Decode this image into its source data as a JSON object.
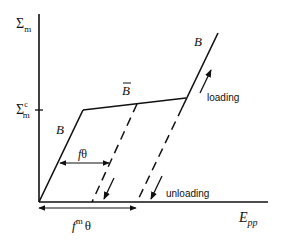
{
  "diagram": {
    "type": "stress-strain loading/unloading schematic",
    "axes": {
      "y_label": "Σm",
      "y_label_main": "Σ",
      "y_label_sub": "m",
      "x_label_main": "E",
      "x_label_sub": "pp",
      "y_tick_label_main": "Σ",
      "y_tick_label_sub": "m",
      "y_tick_label_sup": "c"
    },
    "segments": {
      "initial_branch_label": "B",
      "plateau_label": "B",
      "reload_branch_label": "B"
    },
    "annotations": {
      "loading": "loading",
      "unloading": "unloading",
      "f_theta_f": "f",
      "f_theta_theta": "θ",
      "fm_theta_f": "f",
      "fm_theta_sup": "m",
      "fm_theta_theta": "θ"
    },
    "colors": {
      "line": "#111111",
      "background": "#ffffff"
    }
  }
}
